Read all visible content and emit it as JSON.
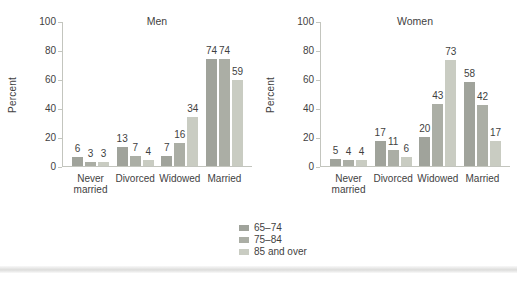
{
  "chart_data": [
    {
      "type": "bar",
      "title": "Men",
      "ylabel": "Percent",
      "xlabel": "",
      "ylim": [
        0,
        100
      ],
      "yticks": [
        0,
        20,
        40,
        60,
        80,
        100
      ],
      "grid": false,
      "categories": [
        "Never married",
        "Divorced",
        "Widowed",
        "Married"
      ],
      "series": [
        {
          "name": "65–74",
          "color": "#a0a39b",
          "values": [
            6,
            13,
            7,
            74
          ]
        },
        {
          "name": "75–84",
          "color": "#abaea5",
          "values": [
            3,
            7,
            16,
            74
          ]
        },
        {
          "name": "85 and over",
          "color": "#c9ccc2",
          "values": [
            3,
            4,
            34,
            59
          ]
        }
      ]
    },
    {
      "type": "bar",
      "title": "Women",
      "ylabel": "Percent",
      "xlabel": "",
      "ylim": [
        0,
        100
      ],
      "yticks": [
        0,
        20,
        40,
        60,
        80,
        100
      ],
      "grid": false,
      "categories": [
        "Never married",
        "Divorced",
        "Widowed",
        "Married"
      ],
      "series": [
        {
          "name": "65–74",
          "color": "#a0a39b",
          "values": [
            5,
            17,
            20,
            58
          ]
        },
        {
          "name": "75–84",
          "color": "#abaea5",
          "values": [
            4,
            11,
            43,
            42
          ]
        },
        {
          "name": "85 and over",
          "color": "#c9ccc2",
          "values": [
            4,
            6,
            73,
            17
          ]
        }
      ]
    }
  ],
  "legend": {
    "position": "bottom-center",
    "entries": [
      {
        "label": "65–74",
        "color": "#a0a39b"
      },
      {
        "label": "75–84",
        "color": "#abaea5"
      },
      {
        "label": "85 and over",
        "color": "#c9ccc2"
      }
    ]
  },
  "colors": {
    "axis_line": "#c3c5be",
    "text": "#3f3f3f",
    "background": "#ffffff"
  }
}
